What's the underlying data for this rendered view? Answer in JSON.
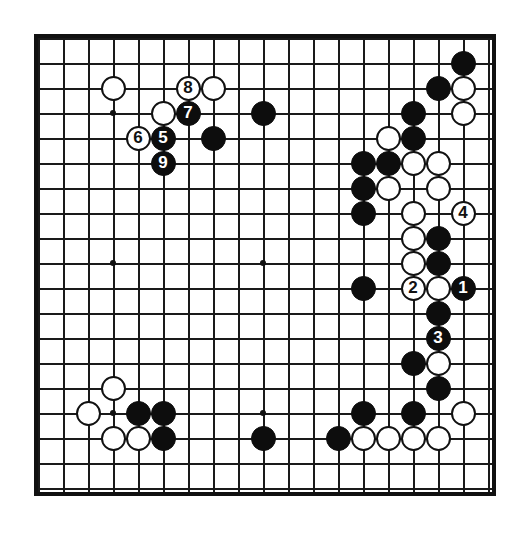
{
  "diagram": {
    "type": "go-board",
    "board_size": 19,
    "colors": {
      "line": "#1a1a1a",
      "border": "#111111",
      "black_stone": "#0d0d0d",
      "white_stone": "#ffffff",
      "background": "#ffffff"
    },
    "star_points": [
      {
        "col": 3,
        "row": 3
      },
      {
        "col": 9,
        "row": 3
      },
      {
        "col": 15,
        "row": 3
      },
      {
        "col": 3,
        "row": 9
      },
      {
        "col": 9,
        "row": 9
      },
      {
        "col": 15,
        "row": 9
      },
      {
        "col": 3,
        "row": 15
      },
      {
        "col": 9,
        "row": 15
      },
      {
        "col": 15,
        "row": 15
      }
    ],
    "stones": [
      {
        "col": 3,
        "row": 2,
        "color": "white",
        "label": ""
      },
      {
        "col": 6,
        "row": 2,
        "color": "white",
        "label": "8"
      },
      {
        "col": 7,
        "row": 2,
        "color": "white",
        "label": ""
      },
      {
        "col": 5,
        "row": 3,
        "color": "white",
        "label": ""
      },
      {
        "col": 6,
        "row": 3,
        "color": "black",
        "label": "7"
      },
      {
        "col": 9,
        "row": 3,
        "color": "black",
        "label": ""
      },
      {
        "col": 4,
        "row": 4,
        "color": "white",
        "label": "6"
      },
      {
        "col": 5,
        "row": 4,
        "color": "black",
        "label": "5"
      },
      {
        "col": 7,
        "row": 4,
        "color": "black",
        "label": ""
      },
      {
        "col": 5,
        "row": 5,
        "color": "black",
        "label": "9"
      },
      {
        "col": 17,
        "row": 1,
        "color": "black",
        "label": ""
      },
      {
        "col": 16,
        "row": 2,
        "color": "black",
        "label": ""
      },
      {
        "col": 17,
        "row": 2,
        "color": "white",
        "label": ""
      },
      {
        "col": 15,
        "row": 3,
        "color": "black",
        "label": ""
      },
      {
        "col": 17,
        "row": 3,
        "color": "white",
        "label": ""
      },
      {
        "col": 14,
        "row": 4,
        "color": "white",
        "label": ""
      },
      {
        "col": 15,
        "row": 4,
        "color": "black",
        "label": ""
      },
      {
        "col": 13,
        "row": 5,
        "color": "black",
        "label": ""
      },
      {
        "col": 14,
        "row": 5,
        "color": "black",
        "label": ""
      },
      {
        "col": 15,
        "row": 5,
        "color": "white",
        "label": ""
      },
      {
        "col": 16,
        "row": 5,
        "color": "white",
        "label": ""
      },
      {
        "col": 13,
        "row": 6,
        "color": "black",
        "label": ""
      },
      {
        "col": 14,
        "row": 6,
        "color": "white",
        "label": ""
      },
      {
        "col": 16,
        "row": 6,
        "color": "white",
        "label": ""
      },
      {
        "col": 13,
        "row": 7,
        "color": "black",
        "label": ""
      },
      {
        "col": 15,
        "row": 7,
        "color": "white",
        "label": ""
      },
      {
        "col": 17,
        "row": 7,
        "color": "white",
        "label": "4"
      },
      {
        "col": 15,
        "row": 8,
        "color": "white",
        "label": ""
      },
      {
        "col": 16,
        "row": 8,
        "color": "black",
        "label": ""
      },
      {
        "col": 15,
        "row": 9,
        "color": "white",
        "label": ""
      },
      {
        "col": 16,
        "row": 9,
        "color": "black",
        "label": ""
      },
      {
        "col": 13,
        "row": 10,
        "color": "black",
        "label": ""
      },
      {
        "col": 15,
        "row": 10,
        "color": "white",
        "label": "2"
      },
      {
        "col": 16,
        "row": 10,
        "color": "white",
        "label": ""
      },
      {
        "col": 17,
        "row": 10,
        "color": "black",
        "label": "1"
      },
      {
        "col": 16,
        "row": 11,
        "color": "black",
        "label": ""
      },
      {
        "col": 16,
        "row": 12,
        "color": "black",
        "label": "3"
      },
      {
        "col": 15,
        "row": 13,
        "color": "black",
        "label": ""
      },
      {
        "col": 16,
        "row": 13,
        "color": "white",
        "label": ""
      },
      {
        "col": 16,
        "row": 14,
        "color": "black",
        "label": ""
      },
      {
        "col": 13,
        "row": 15,
        "color": "black",
        "label": ""
      },
      {
        "col": 15,
        "row": 15,
        "color": "black",
        "label": ""
      },
      {
        "col": 17,
        "row": 15,
        "color": "white",
        "label": ""
      },
      {
        "col": 12,
        "row": 16,
        "color": "black",
        "label": ""
      },
      {
        "col": 13,
        "row": 16,
        "color": "white",
        "label": ""
      },
      {
        "col": 14,
        "row": 16,
        "color": "white",
        "label": ""
      },
      {
        "col": 15,
        "row": 16,
        "color": "white",
        "label": ""
      },
      {
        "col": 16,
        "row": 16,
        "color": "white",
        "label": ""
      },
      {
        "col": 3,
        "row": 14,
        "color": "white",
        "label": ""
      },
      {
        "col": 2,
        "row": 15,
        "color": "white",
        "label": ""
      },
      {
        "col": 4,
        "row": 15,
        "color": "black",
        "label": ""
      },
      {
        "col": 5,
        "row": 15,
        "color": "black",
        "label": ""
      },
      {
        "col": 3,
        "row": 16,
        "color": "white",
        "label": ""
      },
      {
        "col": 4,
        "row": 16,
        "color": "white",
        "label": ""
      },
      {
        "col": 5,
        "row": 16,
        "color": "black",
        "label": ""
      },
      {
        "col": 9,
        "row": 16,
        "color": "black",
        "label": ""
      }
    ],
    "move_numbers": [
      "1",
      "2",
      "3",
      "4",
      "5",
      "6",
      "7",
      "8",
      "9"
    ]
  }
}
